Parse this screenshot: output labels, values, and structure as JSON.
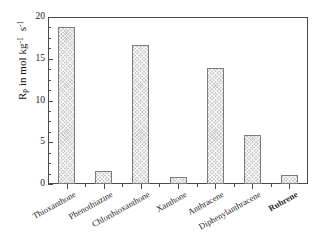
{
  "chart_data": {
    "type": "bar",
    "title": "",
    "xlabel": "",
    "ylabel": "Rp in mol kg-1 s-1",
    "ylabel_parts": {
      "symbol": "R",
      "symbol_sub": "p",
      "text": "in mol",
      "unit1": "kg",
      "unit1_exp": "-1",
      "unit2": "s",
      "unit2_exp": "-1"
    },
    "categories": [
      "Thioxanthone",
      "Phenothiazine",
      "Chlorthioxanthone",
      "Xanthone",
      "Anthracene",
      "Diphenylanthracene",
      "Rubrene"
    ],
    "values": [
      18.8,
      1.5,
      16.6,
      0.85,
      13.9,
      5.9,
      1.05
    ],
    "ylim": [
      0,
      20
    ],
    "yticks": [
      0,
      5,
      10,
      15,
      20
    ],
    "ytick_labels": [
      "0",
      "5",
      "10",
      "15",
      "20"
    ],
    "yminor_step": 1.25,
    "grid": false,
    "legend": null,
    "bar_color": "#c9c9c9",
    "bar_edge_color": "#7d7d7d",
    "axis_color": "#4a4a4a",
    "emphasis_category": "Rubrene"
  }
}
